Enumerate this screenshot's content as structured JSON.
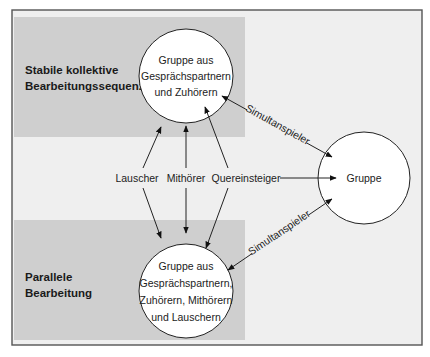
{
  "diagram": {
    "colors": {
      "frame_bg": "#efefef",
      "band": "#cfcfcf",
      "circle_fill": "#ffffff",
      "stroke": "#222222"
    },
    "bands": [
      {
        "label_line1": "Stabile kollektive",
        "label_line2": "Bearbeitungssequenz"
      },
      {
        "label_line1": "Parallele",
        "label_line2": "Bearbeitung"
      }
    ],
    "nodes": {
      "top_circle": {
        "lines": [
          "Gruppe aus",
          "Gesprächspartnern",
          "und Zuhörern"
        ]
      },
      "bottom_circle": {
        "lines": [
          "Gruppe aus",
          "Gesprächspartnern,",
          "Zuhörern, Mithörern",
          "und Lauschern"
        ]
      },
      "right_circle": {
        "lines": [
          "Gruppe"
        ]
      }
    },
    "edge_labels": {
      "lauscher": "Lauscher",
      "mithoerer": "Mithörer",
      "quereinsteiger": "Quereinsteiger",
      "simultanspieler_top": "Simultanspieler",
      "simultanspieler_bottom": "Simultanspieler"
    }
  }
}
